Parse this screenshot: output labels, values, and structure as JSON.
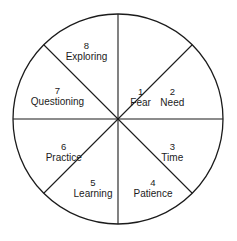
{
  "diagram": {
    "shape": "circle",
    "background_color": "#ffffff",
    "stroke_color": "#1b1b1b",
    "text_color": "#1b1b1b",
    "center": {
      "x": 118,
      "y": 119
    },
    "radius": 105,
    "label_radius_ratio": 0.56,
    "segment_count": 8,
    "segments": [
      {
        "number": "1",
        "name": "Fear",
        "mid_angle_deg": -67.5
      },
      {
        "number": "2",
        "name": "Need",
        "mid_angle_deg": -22.5
      },
      {
        "number": "3",
        "name": "Time",
        "mid_angle_deg": 22.5
      },
      {
        "number": "4",
        "name": "Patience",
        "mid_angle_deg": 67.5
      },
      {
        "number": "5",
        "name": "Learning",
        "mid_angle_deg": 112.5
      },
      {
        "number": "6",
        "name": "Practice",
        "mid_angle_deg": 157.5
      },
      {
        "number": "7",
        "name": "Questioning",
        "mid_angle_deg": 202.5
      },
      {
        "number": "8",
        "name": "Exploring",
        "mid_angle_deg": 247.5
      }
    ],
    "divider_angles_deg": [
      0,
      45,
      90,
      135
    ]
  }
}
